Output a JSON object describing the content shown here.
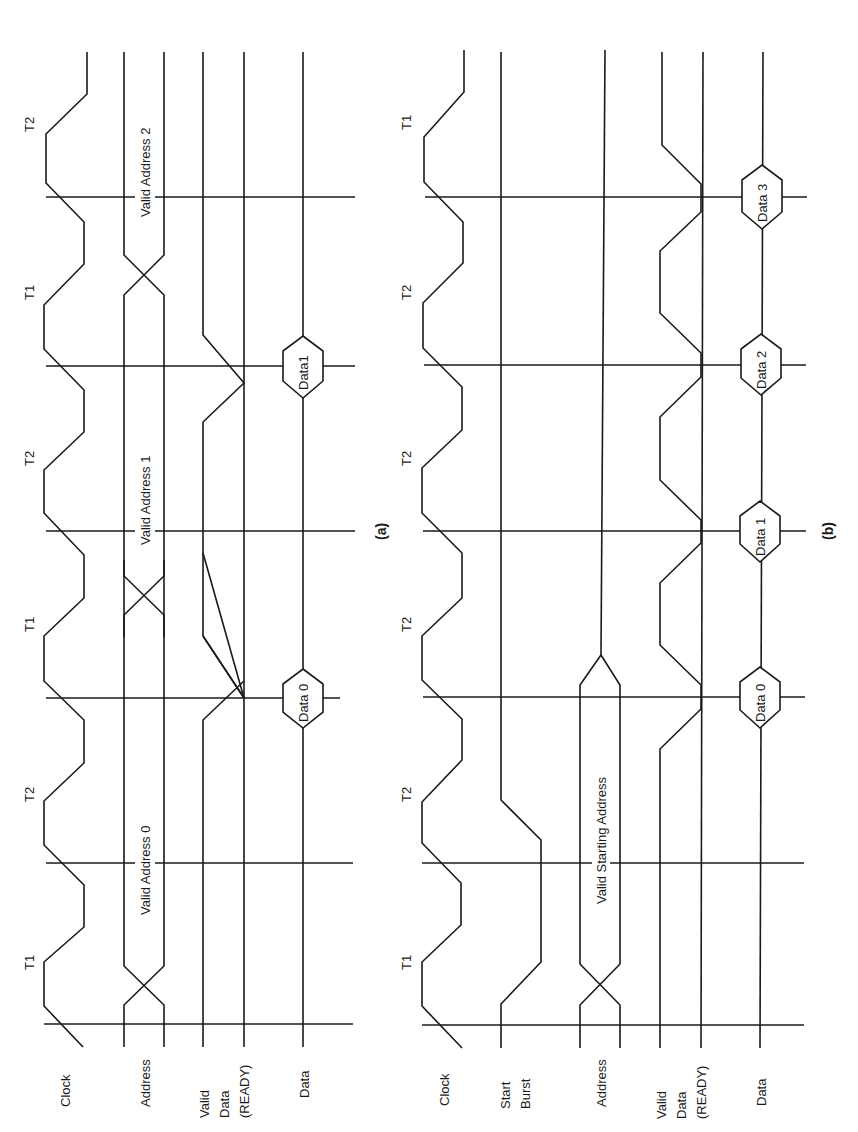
{
  "figure": {
    "orientation": "rotated-90-ccw",
    "line_color": "#1a1a1a",
    "background": "#ffffff"
  },
  "diagram_a": {
    "caption": "(a)",
    "signals": [
      "Clock",
      "Address",
      "Valid",
      "Data",
      "(READY)",
      "Data"
    ],
    "signal_labels": {
      "clock": "Clock",
      "address": "Address",
      "ready_line1": "Valid",
      "ready_line2": "Data",
      "ready_line3": "(READY)",
      "data": "Data"
    },
    "cycle_labels": [
      "T1",
      "T2",
      "T1",
      "T2",
      "T1",
      "T2"
    ],
    "address_values": [
      "Valid Address 0",
      "Valid Address 1",
      "Valid Address 2"
    ],
    "data_values": [
      "Data 0",
      "Data1"
    ]
  },
  "diagram_b": {
    "caption": "(b)",
    "signal_labels": {
      "clock": "Clock",
      "start_line1": "Start",
      "start_line2": "Burst",
      "address": "Address",
      "ready_line1": "Valid",
      "ready_line2": "Data",
      "ready_line3": "(READY)",
      "data": "Data"
    },
    "cycle_labels": [
      "T1",
      "T2",
      "T2",
      "T2",
      "T2",
      "T1"
    ],
    "address_values": [
      "Valid Starting Address"
    ],
    "data_values": [
      "Data 0",
      "Data 1",
      "Data 2",
      "Data 3"
    ]
  }
}
